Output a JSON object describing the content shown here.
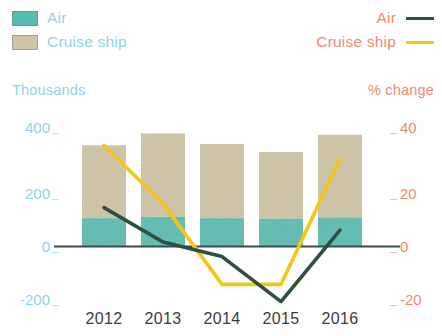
{
  "legend_left": {
    "items": [
      {
        "label": "Air",
        "color": "#55bcb0",
        "icon": "square-swatch-icon"
      },
      {
        "label": "Cruise ship",
        "color": "#cfc5a5",
        "icon": "square-swatch-icon"
      }
    ],
    "text_color": "#8fd2ea"
  },
  "legend_right": {
    "items": [
      {
        "label": "Air",
        "color": "#2f4f41",
        "icon": "line-key-icon"
      },
      {
        "label": "Cruise ship",
        "color": "#f5c518",
        "icon": "line-key-icon"
      }
    ],
    "text_color": "#f08a6e"
  },
  "axis_left": {
    "title": "Thousands",
    "ticks": [
      "400",
      "200",
      "0",
      "-200"
    ],
    "color": "#8fd2ea"
  },
  "axis_right": {
    "title": "% change",
    "ticks": [
      "40",
      "20",
      "0",
      "-20"
    ],
    "color": "#f08a6e"
  },
  "axis_x": {
    "labels": [
      "2012",
      "2013",
      "2014",
      "2015",
      "2016"
    ],
    "color": "#3c3c3c"
  },
  "chart_data": {
    "type": "bar",
    "title": "",
    "subtitle": "",
    "xlabel": "",
    "ylabel": "Thousands",
    "y2label": "% change",
    "categories": [
      "2012",
      "2013",
      "2014",
      "2015",
      "2016"
    ],
    "ylim": [
      -200,
      400
    ],
    "y2lim": [
      -20,
      40
    ],
    "yticks": [
      -200,
      0,
      200,
      400
    ],
    "y2ticks": [
      -20,
      0,
      20,
      40
    ],
    "grid": false,
    "legend_position": "top",
    "bar_stacked": true,
    "series": [
      {
        "name": "Air",
        "kind": "bar",
        "stack": "arrivals",
        "axis": "left",
        "color": "#55bcb0",
        "values": [
          105,
          110,
          105,
          103,
          108
        ]
      },
      {
        "name": "Cruise ship",
        "kind": "bar",
        "stack": "arrivals",
        "axis": "left",
        "color": "#cfc5a5",
        "values": [
          275,
          315,
          280,
          252,
          312
        ]
      },
      {
        "name": "Air",
        "kind": "line",
        "axis": "right",
        "color": "#2f4f41",
        "values": [
          14.5,
          1.5,
          -4,
          -21,
          6
        ]
      },
      {
        "name": "Cruise ship",
        "kind": "line",
        "axis": "right",
        "color": "#f5c518",
        "values": [
          38,
          16,
          -14.5,
          -14.5,
          33
        ]
      }
    ]
  },
  "geometry": {
    "plot_left": 62,
    "plot_right": 396,
    "zero_y": 246,
    "px_per_100k": 26.5,
    "bar_width": 44,
    "category_centers": [
      104,
      163,
      222,
      281,
      340
    ],
    "tick_y": {
      "t400": 140,
      "t200": 193,
      "t0": 246,
      "tm200": 299
    }
  }
}
